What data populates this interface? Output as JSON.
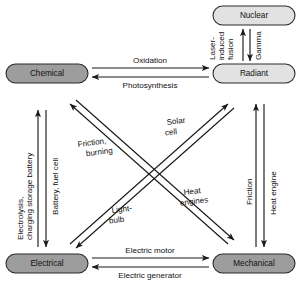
{
  "diagram": {
    "type": "energy-conversion-network",
    "colors": {
      "node_fill_dark": "#9d9d9d",
      "node_fill_light": "#e2e2e2",
      "node_stroke": "#2b2b2b",
      "edge_stroke": "#1a1a1a",
      "text": "#111111",
      "background": "#ffffff"
    },
    "nodes": [
      {
        "id": "nuclear",
        "label": "Nuclear",
        "shade": "light"
      },
      {
        "id": "radiant",
        "label": "Radiant",
        "shade": "light"
      },
      {
        "id": "chemical",
        "label": "Chemical",
        "shade": "dark"
      },
      {
        "id": "electrical",
        "label": "Electrical",
        "shade": "dark"
      },
      {
        "id": "mechanical",
        "label": "Mechanical",
        "shade": "dark"
      }
    ],
    "edges": [
      {
        "id": "nuclear-to-radiant",
        "from": "nuclear",
        "to": "radiant",
        "label": "Gamma",
        "lines": [
          "Gamma"
        ]
      },
      {
        "id": "radiant-to-nuclear",
        "from": "radiant",
        "to": "nuclear",
        "label": "Laser-induced fusion",
        "lines": [
          "Laser-",
          "induced",
          "fusion"
        ]
      },
      {
        "id": "chemical-to-radiant",
        "from": "chemical",
        "to": "radiant",
        "label": "Oxidation",
        "lines": [
          "Oxidation"
        ]
      },
      {
        "id": "radiant-to-chemical",
        "from": "radiant",
        "to": "chemical",
        "label": "Photosynthesis",
        "lines": [
          "Photosynthesis"
        ]
      },
      {
        "id": "chemical-to-electrical",
        "from": "chemical",
        "to": "electrical",
        "label": "Battery, fuel cell",
        "lines": [
          "Battery, fuel cell"
        ]
      },
      {
        "id": "electrical-to-chemical",
        "from": "electrical",
        "to": "chemical",
        "label": "Electrolysis, charging storage battery",
        "lines": [
          "Electrolysis,",
          "charging storage battery"
        ]
      },
      {
        "id": "radiant-to-mechanical",
        "from": "radiant",
        "to": "mechanical",
        "label": "Heat engine",
        "lines": [
          "Heat engine"
        ]
      },
      {
        "id": "mechanical-to-radiant",
        "from": "mechanical",
        "to": "radiant",
        "label": "Friction",
        "lines": [
          "Friction"
        ]
      },
      {
        "id": "electrical-to-mechanical",
        "from": "electrical",
        "to": "mechanical",
        "label": "Electric motor",
        "lines": [
          "Electric motor"
        ]
      },
      {
        "id": "mechanical-to-electrical",
        "from": "mechanical",
        "to": "electrical",
        "label": "Electric generator",
        "lines": [
          "Electric generator"
        ]
      },
      {
        "id": "mechanical-to-chemical",
        "from": "mechanical",
        "to": "chemical",
        "label": "Friction, burning",
        "lines": [
          "Friction,",
          "burning"
        ]
      },
      {
        "id": "radiant-to-electrical",
        "from": "radiant",
        "to": "electrical",
        "label": "Solar cell",
        "lines": [
          "Solar",
          "cell"
        ]
      },
      {
        "id": "electrical-to-radiant",
        "from": "electrical",
        "to": "radiant",
        "label": "Light-bulb",
        "lines": [
          "Light-",
          "bulb"
        ]
      },
      {
        "id": "chemical-to-mechanical",
        "from": "chemical",
        "to": "mechanical",
        "label": "Heat engines",
        "lines": [
          "Heat",
          "engines"
        ]
      }
    ],
    "labels": {
      "nuclear": "Nuclear",
      "radiant": "Radiant",
      "chemical": "Chemical",
      "electrical": "Electrical",
      "mechanical": "Mechanical",
      "gamma": "Gamma",
      "laser_1": "Laser-",
      "laser_2": "induced",
      "laser_3": "fusion",
      "oxidation": "Oxidation",
      "photosynthesis": "Photosynthesis",
      "battery_fuel_cell": "Battery, fuel cell",
      "electrolysis_1": "Electrolysis,",
      "electrolysis_2": "charging storage battery",
      "heat_engine": "Heat engine",
      "friction": "Friction",
      "electric_motor": "Electric motor",
      "electric_generator": "Electric generator",
      "friction_burning_1": "Friction,",
      "friction_burning_2": "burning",
      "solar_1": "Solar",
      "solar_2": "cell",
      "lightbulb_1": "Light-",
      "lightbulb_2": "bulb",
      "heat_engines_1": "Heat",
      "heat_engines_2": "engines"
    }
  }
}
